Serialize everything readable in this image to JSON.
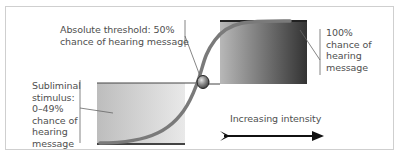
{
  "diagram": {
    "labels": {
      "threshold": "Absolute threshold: 50%\nchance of hearing message",
      "subliminal": "Subliminal\nstimulus:\n0–49%\nchance of\nhearing\nmessage",
      "full": "100%\nchance of\nhearing\nmessage",
      "intensity": "Increasing intensity"
    },
    "colors": {
      "curve": "#7a7a7a",
      "frame": "#cfcfcf",
      "low_box_light": "#e6e6e6",
      "low_box_dark": "#bdbdbd",
      "high_box_light": "#b5b5b5",
      "high_box_dark": "#3a3a3a",
      "arrow": "#111111",
      "threshold_point": "#6f6f6f"
    },
    "icons": {
      "threshold_marker": "sphere-marker-icon",
      "direction": "arrow-right-icon"
    }
  }
}
